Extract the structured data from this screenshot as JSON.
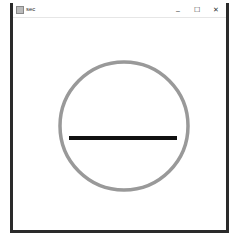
{
  "window": {
    "title": "sec",
    "controls": {
      "minimize": "–",
      "maximize": "☐",
      "close": "✕"
    }
  },
  "drawing": {
    "circle": {
      "cx": 111,
      "cy": 109,
      "r": 64,
      "stroke": "#999999",
      "stroke_width": 3.5
    },
    "line": {
      "x1": 56,
      "y1": 121,
      "x2": 164,
      "y2": 121,
      "stroke": "#111111",
      "stroke_width": 4
    }
  }
}
